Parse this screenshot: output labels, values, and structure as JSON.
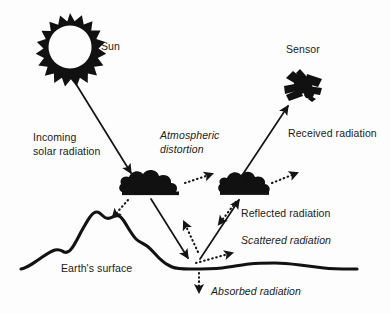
{
  "diagram": {
    "background_color": "#fdfdfd",
    "ink_color": "#111111",
    "labels": {
      "sun": "Sun",
      "sensor": "Sensor",
      "incoming_line1": "Incoming",
      "incoming_line2": "solar radiation",
      "atmospheric_line1": "Atmospheric",
      "atmospheric_line2": "distortion",
      "received": "Received radiation",
      "reflected": "Reflected radiation",
      "scattered": "Scattered radiation",
      "absorbed": "Absorbed radiation",
      "earth_surface": "Earth's surface"
    },
    "icons": {
      "sun": "sun-icon",
      "sensor": "satellite-icon",
      "cloud_left": "cloud-icon",
      "cloud_right": "cloud-icon"
    },
    "arrows": [
      {
        "name": "incoming-solar-arrow",
        "style": "solid",
        "from": "sun",
        "to": "cloud-left"
      },
      {
        "name": "atmospheric-distortion-arrow",
        "style": "dotted",
        "from": "cloud-left",
        "to": "upper-right"
      },
      {
        "name": "cloud-left-to-ground-arrow",
        "style": "solid",
        "from": "cloud-left",
        "to": "ground"
      },
      {
        "name": "cloud-left-downleft-dotted-arrow",
        "style": "dotted",
        "from": "cloud-left",
        "to": "mountain"
      },
      {
        "name": "ground-to-cloud-left-dotted-arrow",
        "style": "dotted",
        "from": "ground",
        "to": "cloud-left"
      },
      {
        "name": "ground-to-cloud-right-arrow",
        "style": "solid",
        "from": "ground",
        "to": "cloud-right"
      },
      {
        "name": "cloud-right-downleft-dotted-arrow",
        "style": "dotted",
        "from": "cloud-right",
        "to": "ground"
      },
      {
        "name": "scattered-radiation-dotted-arrow",
        "style": "dotted",
        "from": "ground",
        "to": "right"
      },
      {
        "name": "cloud-right-to-sensor-arrow",
        "style": "solid",
        "from": "cloud-right",
        "to": "sensor"
      },
      {
        "name": "cloud-right-upright-dotted-arrow",
        "style": "dotted",
        "from": "cloud-right",
        "to": "upper-right"
      },
      {
        "name": "absorbed-radiation-dotted-arrow",
        "style": "dotted",
        "from": "ground",
        "to": "subsurface"
      }
    ]
  }
}
